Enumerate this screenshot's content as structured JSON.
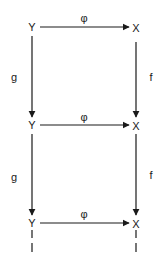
{
  "diagram": {
    "type": "commutative-diagram",
    "nodes": [
      {
        "id": "Y1",
        "label": "Y",
        "x": 32,
        "y": 27
      },
      {
        "id": "X1",
        "label": "X",
        "x": 136,
        "y": 27
      },
      {
        "id": "Y2",
        "label": "Y",
        "x": 32,
        "y": 125
      },
      {
        "id": "X2",
        "label": "X",
        "x": 136,
        "y": 125
      },
      {
        "id": "Y3",
        "label": "Y",
        "x": 32,
        "y": 223
      },
      {
        "id": "X3",
        "label": "X",
        "x": 136,
        "y": 223
      }
    ],
    "edges": [
      {
        "from": "Y1",
        "to": "X1",
        "label": "φ"
      },
      {
        "from": "Y2",
        "to": "X2",
        "label": "φ"
      },
      {
        "from": "Y3",
        "to": "X3",
        "label": "φ"
      },
      {
        "from": "Y1",
        "to": "Y2",
        "label": "g"
      },
      {
        "from": "Y2",
        "to": "Y3",
        "label": "g"
      },
      {
        "from": "X1",
        "to": "X2",
        "label": "f"
      },
      {
        "from": "X2",
        "to": "X3",
        "label": "f"
      }
    ],
    "continuation": "dashed vertical lines below bottom row"
  }
}
